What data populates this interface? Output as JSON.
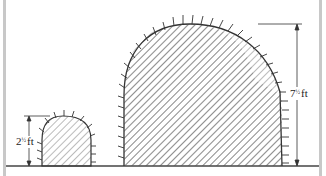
{
  "diagram": {
    "type": "cross-section comparison",
    "small_tunnel": {
      "height_label": "2½ ft",
      "height_whole": "2",
      "height_frac": "½",
      "unit": "ft"
    },
    "large_tunnel": {
      "height_label": "7½ ft",
      "height_whole": "7",
      "height_frac": "½",
      "unit": "ft"
    },
    "colors": {
      "stroke": "#333333",
      "hatch": "#555555",
      "frame": "#c8c8c8",
      "background": "#ffffff"
    }
  }
}
